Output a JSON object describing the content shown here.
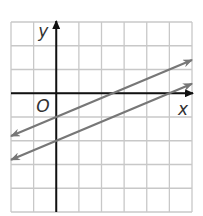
{
  "chart_data": {
    "type": "line",
    "title": "",
    "xlabel": "x",
    "ylabel": "y",
    "origin_label": "O",
    "xlim": [
      -2,
      6
    ],
    "ylim": [
      -5,
      3
    ],
    "grid": true,
    "grid_step": 1,
    "series": [
      {
        "name": "upper line",
        "slope": 0.4,
        "intercept": -1,
        "x": [
          -2,
          6
        ],
        "y": [
          -1.8,
          1.4
        ],
        "arrows": "both"
      },
      {
        "name": "lower line",
        "slope": 0.4,
        "intercept": -2,
        "x": [
          -2,
          6
        ],
        "y": [
          -2.8,
          0.4
        ],
        "arrows": "both"
      }
    ]
  },
  "colors": {
    "grid": "#c8c8c8",
    "axis": "#111111",
    "lines": "#777777"
  }
}
